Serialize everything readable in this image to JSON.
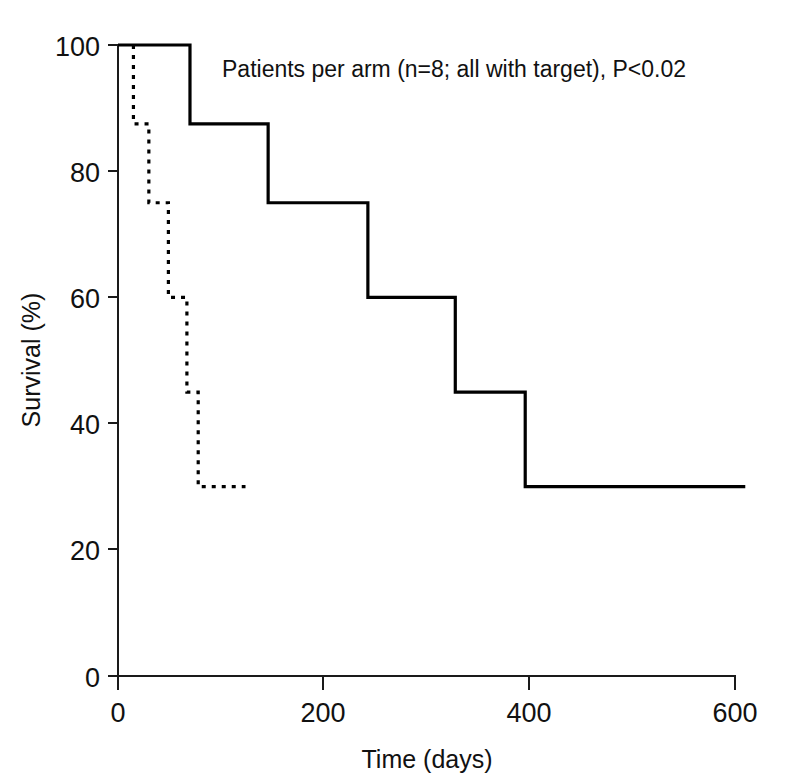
{
  "figure": {
    "background_color": "#ffffff",
    "line_color": "#000000",
    "annotation": "Patients per arm (n=8; all with target), P<0.02"
  },
  "chart_data": {
    "type": "line",
    "subtype": "kaplan-meier-step",
    "title": "",
    "subtitle": "",
    "xlabel": "Time (days)",
    "ylabel": "Survival (%)",
    "xlim": [
      0,
      600
    ],
    "ylim": [
      0,
      100
    ],
    "xticks": [
      0,
      200,
      400,
      600
    ],
    "xticklabels": [
      "0",
      "200",
      "400",
      "600"
    ],
    "yticks": [
      0,
      20,
      40,
      60,
      80,
      100
    ],
    "yticklabels": [
      "0",
      "20",
      "40",
      "60",
      "80",
      "100"
    ],
    "grid": false,
    "legend": "none",
    "annotations": [
      {
        "text": "Patients per arm (n=8; all with target), P<0.02",
        "x": 100,
        "y": 96
      }
    ],
    "series": [
      {
        "name": "treatment-arm",
        "style": "solid",
        "color": "#000000",
        "n": 8,
        "steps": [
          {
            "x": 0,
            "y": 100
          },
          {
            "x": 70,
            "y": 100
          },
          {
            "x": 70,
            "y": 87.5
          },
          {
            "x": 146,
            "y": 87.5
          },
          {
            "x": 146,
            "y": 75
          },
          {
            "x": 243,
            "y": 75
          },
          {
            "x": 243,
            "y": 60
          },
          {
            "x": 328,
            "y": 60
          },
          {
            "x": 328,
            "y": 45
          },
          {
            "x": 396,
            "y": 45
          },
          {
            "x": 396,
            "y": 30
          },
          {
            "x": 610,
            "y": 30
          }
        ]
      },
      {
        "name": "control-arm",
        "style": "dashed",
        "color": "#000000",
        "n": 8,
        "steps": [
          {
            "x": 15,
            "y": 100
          },
          {
            "x": 15,
            "y": 87.5
          },
          {
            "x": 30,
            "y": 87.5
          },
          {
            "x": 30,
            "y": 75
          },
          {
            "x": 49,
            "y": 75
          },
          {
            "x": 49,
            "y": 60
          },
          {
            "x": 67,
            "y": 60
          },
          {
            "x": 67,
            "y": 45
          },
          {
            "x": 78,
            "y": 45
          },
          {
            "x": 78,
            "y": 30
          },
          {
            "x": 124,
            "y": 30
          }
        ]
      }
    ]
  }
}
